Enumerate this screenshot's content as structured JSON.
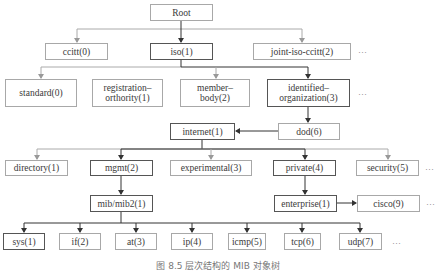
{
  "diagram": {
    "nodes": {
      "root": {
        "label": "Root"
      },
      "ccitt": {
        "label": "ccitt(0)"
      },
      "iso": {
        "label": "iso(1)"
      },
      "joint": {
        "label": "joint-iso-ccitt(2)"
      },
      "standard": {
        "label": "standard(0)"
      },
      "registration": {
        "line1": "registration–",
        "line2": "orthority(1)"
      },
      "member": {
        "line1": "member–",
        "line2": "body(2)"
      },
      "identified": {
        "line1": "identified–",
        "line2": "organization(3)"
      },
      "dod": {
        "label": "dod(6)"
      },
      "internet": {
        "label": "internet(1)"
      },
      "directory": {
        "label": "directory(1)"
      },
      "mgmt": {
        "label": "mgmt(2)"
      },
      "experimental": {
        "label": "experimental(3)"
      },
      "private": {
        "label": "private(4)"
      },
      "security": {
        "label": "security(5)"
      },
      "mib": {
        "label": "mib/mib2(1)"
      },
      "enterprise": {
        "label": "enterprise(1)"
      },
      "cisco": {
        "label": "cisco(9)"
      },
      "sys": {
        "label": "sys(1)"
      },
      "if": {
        "label": "if(2)"
      },
      "at": {
        "label": "at(3)"
      },
      "ip": {
        "label": "ip(4)"
      },
      "icmp": {
        "label": "icmp(5)"
      },
      "tcp": {
        "label": "tcp(6)"
      },
      "udp": {
        "label": "udp(7)"
      }
    },
    "ellipsis": "…",
    "caption": "图 8.5   层次结构的 MIB 对象树"
  }
}
